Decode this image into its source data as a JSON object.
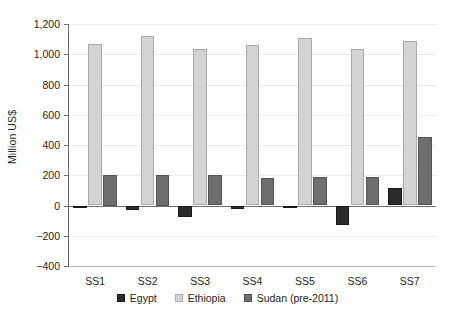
{
  "chart_data": {
    "type": "bar",
    "title": "",
    "xlabel": "",
    "ylabel": "Million US$",
    "categories": [
      "SS1",
      "SS2",
      "SS3",
      "SS4",
      "SS5",
      "SS6",
      "SS7"
    ],
    "series": [
      {
        "name": "Egypt",
        "color": "#2b2b2b",
        "values": [
          -12,
          -30,
          -75,
          -20,
          -8,
          -130,
          115
        ]
      },
      {
        "name": "Ethiopia",
        "color": "#d4d4d4",
        "values": [
          1068,
          1118,
          1035,
          1063,
          1108,
          1032,
          1090
        ]
      },
      {
        "name": "Sudan (pre-2011)",
        "color": "#6e6e6e",
        "values": [
          200,
          200,
          202,
          185,
          186,
          190,
          455
        ]
      }
    ],
    "ylim": [
      -400,
      1200
    ],
    "ytick_labels": [
      "1,200",
      "1,000",
      "800",
      "600",
      "400",
      "200",
      "0",
      "−200",
      "−400"
    ],
    "ytick_values": [
      1200,
      1000,
      800,
      600,
      400,
      200,
      0,
      -200,
      -400
    ],
    "grid": true,
    "legend_position": "bottom"
  }
}
